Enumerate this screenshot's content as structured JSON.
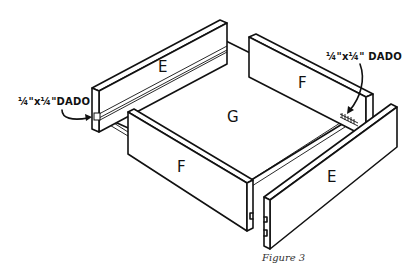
{
  "figure": {
    "caption": "Figure 3",
    "parts": {
      "back_left_panel": "E",
      "back_right_panel": "F",
      "bottom_panel": "G",
      "front_left_panel": "F",
      "front_right_panel": "E"
    },
    "callouts": {
      "left": "¼\"x¼\"DADO",
      "right": "¼\"x¼\" DADO"
    }
  }
}
